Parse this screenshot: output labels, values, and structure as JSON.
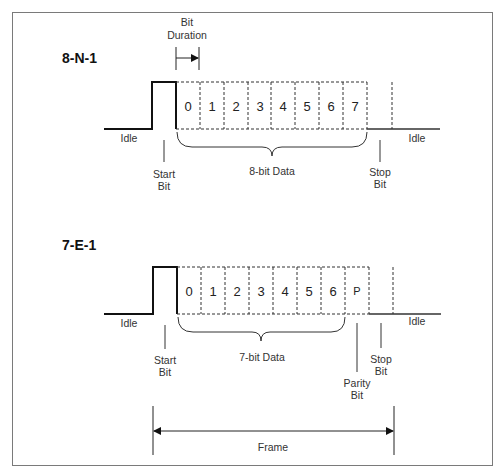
{
  "diagram": {
    "bit_duration_label": [
      "Bit",
      "Duration"
    ],
    "formats": [
      {
        "title": "8-N-1",
        "cells": [
          "0",
          "1",
          "2",
          "3",
          "4",
          "5",
          "6",
          "7"
        ],
        "idle_left": "Idle",
        "idle_right": "Idle",
        "start_bit": [
          "Start",
          "Bit"
        ],
        "data_label": "8-bit Data",
        "stop_bit": [
          "Stop",
          "Bit"
        ]
      },
      {
        "title": "7-E-1",
        "cells": [
          "0",
          "1",
          "2",
          "3",
          "4",
          "5",
          "6",
          "P"
        ],
        "idle_left": "Idle",
        "idle_right": "Idle",
        "start_bit": [
          "Start",
          "Bit"
        ],
        "data_label": "7-bit Data",
        "parity_bit": [
          "Parity",
          "Bit"
        ],
        "stop_bit": [
          "Stop",
          "Bit"
        ]
      }
    ],
    "frame_label": "Frame"
  }
}
